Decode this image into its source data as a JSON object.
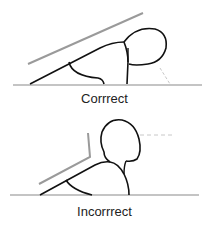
{
  "panels": [
    {
      "label": "Corrrect",
      "posture": "correct"
    },
    {
      "label": "Incorrrect",
      "posture": "incorrect"
    }
  ],
  "colors": {
    "outline": "#111111",
    "guide": "#9a9a9a",
    "floor": "#8a8a8a",
    "dashed": "#c8c8c8"
  }
}
